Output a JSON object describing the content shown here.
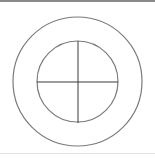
{
  "diagram": {
    "stroke_color": "#7a7a7a",
    "line_color": "#3a3a3a",
    "outer_circle": {
      "cx": 77.5,
      "cy": 81.5,
      "r": 64.5
    },
    "inner_circle": {
      "cx": 77.5,
      "cy": 81.5,
      "r": 40.5
    },
    "crosshair": {
      "horizontal": {
        "x1": 37,
        "y1": 82,
        "x2": 118,
        "y2": 82
      },
      "vertical": {
        "x1": 78,
        "y1": 41,
        "x2": 78,
        "y2": 123
      }
    }
  }
}
